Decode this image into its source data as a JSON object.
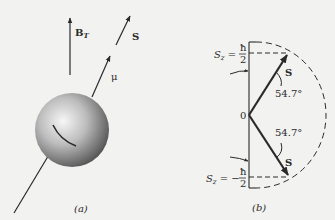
{
  "panel_a": {
    "caption": "(a)",
    "field_label": "B",
    "field_subscript": "T",
    "spin_label": "S",
    "moment_label": "μ"
  },
  "panel_b": {
    "caption": "(b)",
    "origin_label": "0",
    "top_level": {
      "var": "S",
      "sub": "z",
      "eq": " = ",
      "num": "ħ",
      "den": "2"
    },
    "bottom_level": {
      "var": "S",
      "sub": "z",
      "eq": " = −",
      "num": "ħ",
      "den": "2"
    },
    "upper_vector_label": "S",
    "lower_vector_label": "S",
    "upper_angle": "54.7°",
    "lower_angle": "54.7°"
  },
  "colors": {
    "ink": "#2a2a2a",
    "background": "#f2f2f0",
    "sphere_light": "#f4f4f4",
    "sphere_dark": "#4a4a4a"
  }
}
